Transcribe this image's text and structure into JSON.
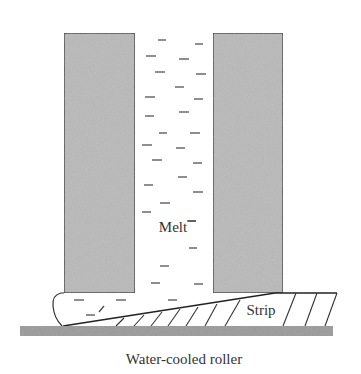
{
  "diagram": {
    "labels": {
      "melt": "Melt",
      "strip": "Strip",
      "roller": "Water-cooled roller"
    },
    "colors": {
      "wall_fill": "#b9b9b9",
      "roller_fill": "#9a9a9a",
      "line": "#333333",
      "background": "#ffffff"
    },
    "components": [
      {
        "id": "left-crucible-wall",
        "type": "refractory wall"
      },
      {
        "id": "right-crucible-wall",
        "type": "refractory wall"
      },
      {
        "id": "melt-channel",
        "type": "liquid metal",
        "label_ref": "melt"
      },
      {
        "id": "solidified-strip",
        "type": "hatched wedge",
        "label_ref": "strip"
      },
      {
        "id": "cooling-roller",
        "type": "substrate",
        "label_ref": "roller"
      }
    ]
  }
}
